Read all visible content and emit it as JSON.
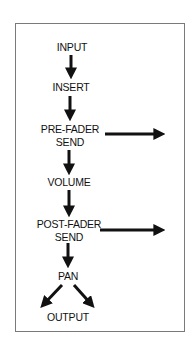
{
  "diagram": {
    "title": "",
    "nodes": [
      {
        "id": "input",
        "label": "INPUT"
      },
      {
        "id": "insert",
        "label": "INSERT"
      },
      {
        "id": "pre_fader_send",
        "label_line1": "PRE-FADER",
        "label_line2": "SEND"
      },
      {
        "id": "volume",
        "label": "VOLUME"
      },
      {
        "id": "post_fader_send",
        "label_line1": "POST-FADER",
        "label_line2": "SEND"
      },
      {
        "id": "pan",
        "label": "PAN"
      },
      {
        "id": "output",
        "label": "OUTPUT"
      }
    ],
    "edges": [
      {
        "from": "input",
        "to": "insert"
      },
      {
        "from": "insert",
        "to": "pre_fader_send"
      },
      {
        "from": "pre_fader_send",
        "to": "external",
        "direction": "right"
      },
      {
        "from": "pre_fader_send",
        "to": "volume"
      },
      {
        "from": "volume",
        "to": "post_fader_send"
      },
      {
        "from": "post_fader_send",
        "to": "external",
        "direction": "right"
      },
      {
        "from": "post_fader_send",
        "to": "pan"
      },
      {
        "from": "pan",
        "to": "output",
        "direction": "down-left"
      },
      {
        "from": "pan",
        "to": "output",
        "direction": "down-right"
      }
    ],
    "colors": {
      "arrow": "#111111",
      "frame": "#7a7a7a",
      "text": "#111111"
    }
  }
}
